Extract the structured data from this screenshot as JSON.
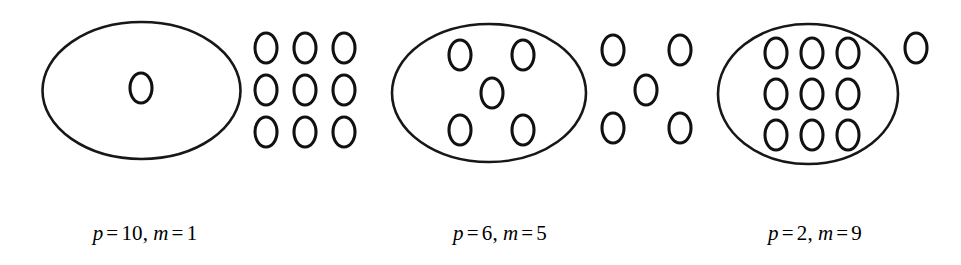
{
  "figure": {
    "name": "place-value-grouping-diagram",
    "background_color": "#ffffff",
    "ink_color": "#111111",
    "unit_glyph": "small-ellipse",
    "group_glyph": "large-ellipse"
  },
  "groups": [
    {
      "id": "group-1",
      "label": {
        "p_var": "p",
        "p_eq": "=",
        "p_value": "10",
        "separator": ",",
        "m_var": "m",
        "m_eq": "=",
        "m_value": "1",
        "text": "p = 10, m = 1"
      },
      "inside_count": 1,
      "outside_count": 9,
      "inside_arrangement": "single-center",
      "outside_arrangement": "3x3-grid"
    },
    {
      "id": "group-2",
      "label": {
        "p_var": "p",
        "p_eq": "=",
        "p_value": "6",
        "separator": ",",
        "m_var": "m",
        "m_eq": "=",
        "m_value": "5",
        "text": "p = 6, m = 5"
      },
      "inside_count": 5,
      "outside_count": 5,
      "inside_arrangement": "quincunx",
      "outside_arrangement": "quincunx"
    },
    {
      "id": "group-3",
      "label": {
        "p_var": "p",
        "p_eq": "=",
        "p_value": "2",
        "separator": ",",
        "m_var": "m",
        "m_eq": "=",
        "m_value": "9",
        "text": "p = 2, m = 9"
      },
      "inside_count": 9,
      "outside_count": 1,
      "inside_arrangement": "3x3-grid",
      "outside_arrangement": "single-upper-right"
    }
  ]
}
